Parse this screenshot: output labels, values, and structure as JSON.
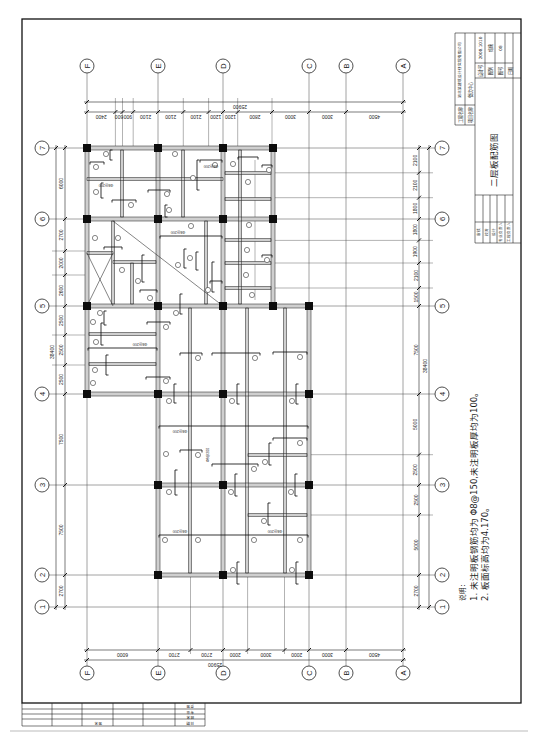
{
  "drawing": {
    "title": "二层板配筋图",
    "notes": {
      "heading": "说明：",
      "items": [
        "1. 未注明板钢筋均为 Φ8@150,未注明板厚均为100。",
        "2. 板面标高均为4.170。"
      ]
    },
    "axes": {
      "letters": [
        "F",
        "E",
        "D",
        "C",
        "B",
        "A"
      ],
      "numbers": [
        "7",
        "6",
        "5",
        "4",
        "3",
        "2",
        "1"
      ]
    },
    "dimensions": {
      "top": {
        "total": "25900",
        "segments": [
          "2400",
          "600",
          "900",
          "2100",
          "2100",
          "2100",
          "1200",
          "1200",
          "2800",
          "3000",
          "3000",
          "4500"
        ]
      },
      "bottom": {
        "total": "25900",
        "segments": [
          "6000",
          "2700",
          "2700",
          "2000",
          "3000",
          "2000",
          "3000",
          "4500"
        ]
      },
      "left": {
        "total": "38400",
        "segments": [
          "6000",
          "2700",
          "2000",
          "2600",
          "2500",
          "2500",
          "2500",
          "7500",
          "7500",
          "2700"
        ]
      },
      "right": {
        "total": "38400",
        "segments": [
          "2100",
          "2100",
          "1800",
          "1800",
          "1900",
          "2100",
          "1500",
          "7500",
          "5000",
          "2500",
          "2500",
          "5000",
          "2700"
        ]
      }
    },
    "slab_labels": [
      "Φ8@200",
      "Φ8@200",
      "Φ8@200",
      "Φ8@200",
      "Φ8@200",
      "Φ8@200",
      "Φ8@200",
      "Φ8@200"
    ]
  },
  "title_block": {
    "company": "湖北某建筑设计研究院有限公司",
    "project_label": "工程名称",
    "project_value": "餐饮中心",
    "item_label": "项目名称",
    "fields": [
      {
        "label": "设计号",
        "value": "2008.1010"
      },
      {
        "label": "图别",
        "value": "结施"
      },
      {
        "label": "图号",
        "value": "08"
      },
      {
        "label": "日期",
        "value": ""
      }
    ],
    "drawing_title": "二层板配筋图",
    "signatures": [
      "审核",
      "校对",
      "设计",
      "专业负责人",
      "工程负责人"
    ]
  },
  "countersign": {
    "cell_label": "签名",
    "column_labels": [
      "会签",
      "专业",
      "姓名",
      "日期"
    ]
  },
  "colors": {
    "ink": "#1a1a1a",
    "beam_fill": "#cfcfcf",
    "column_fill": "#0d0d0d",
    "paper": "#ffffff"
  }
}
